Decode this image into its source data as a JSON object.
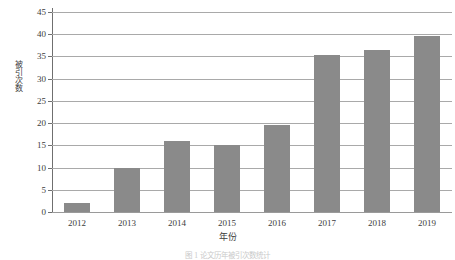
{
  "chart_data": {
    "type": "bar",
    "title": "",
    "subtitle": "",
    "xlabel": "年份",
    "ylabel": "被引次数",
    "categories": [
      "2012",
      "2013",
      "2014",
      "2015",
      "2016",
      "2017",
      "2018",
      "2019"
    ],
    "values": [
      2,
      10,
      16,
      15,
      19.5,
      35.3,
      36.5,
      39.5
    ],
    "series": [
      {
        "name": "被引次数",
        "values": [
          2,
          10,
          16,
          15,
          19.5,
          35.3,
          36.5,
          39.5
        ]
      }
    ],
    "ylim": [
      0,
      45
    ],
    "xlim": [
      0,
      8
    ],
    "yticks": [
      0,
      5,
      10,
      15,
      20,
      25,
      30,
      35,
      40,
      45
    ],
    "ytick_labels": [
      "0",
      "5",
      "10",
      "15",
      "20",
      "25",
      "30",
      "35",
      "40",
      "45"
    ],
    "xtick_labels": [
      "2012",
      "2013",
      "2014",
      "2015",
      "2016",
      "2017",
      "2018",
      "2019"
    ],
    "grid": "horizontal",
    "legend": "none",
    "bar_color": "#8a8a8a",
    "gridline_color": "#a9a9a9",
    "axis_color": "#6f6f6f",
    "background_color": "#ffffff",
    "annotations": []
  },
  "caption": {
    "text": "图 1  论文历年被引次数统计"
  }
}
